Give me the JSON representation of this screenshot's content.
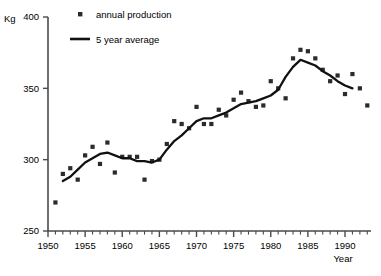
{
  "chart_data": {
    "type": "scatter",
    "title": "",
    "xlabel": "Year",
    "ylabel": "Kg",
    "xlim": [
      1950,
      1993.5
    ],
    "ylim": [
      250,
      400
    ],
    "yticks": [
      250,
      300,
      350,
      400
    ],
    "xticks": [
      1950,
      1955,
      1960,
      1965,
      1970,
      1975,
      1980,
      1985,
      1990
    ],
    "xminor_step": 1,
    "grid": false,
    "legend_position": "top-center",
    "legend": [
      {
        "name": "annual production",
        "marker": "square",
        "color": "#2b2b2b"
      },
      {
        "name": "5 year average",
        "marker": "line",
        "color": "#111111"
      }
    ],
    "series": [
      {
        "name": "annual production",
        "type": "scatter",
        "marker": "square",
        "color": "#2b2b2b",
        "x": [
          1951,
          1952,
          1953,
          1954,
          1955,
          1956,
          1957,
          1958,
          1959,
          1960,
          1961,
          1962,
          1963,
          1964,
          1965,
          1966,
          1967,
          1968,
          1969,
          1970,
          1971,
          1972,
          1973,
          1974,
          1975,
          1976,
          1977,
          1978,
          1979,
          1980,
          1981,
          1982,
          1983,
          1984,
          1985,
          1986,
          1987,
          1988,
          1989,
          1990,
          1991,
          1992,
          1993
        ],
        "y": [
          270,
          290,
          294,
          286,
          303,
          309,
          297,
          312,
          291,
          302,
          302,
          302,
          286,
          299,
          300,
          311,
          327,
          325,
          322,
          337,
          325,
          325,
          335,
          331,
          342,
          347,
          341,
          337,
          338,
          355,
          350,
          343,
          371,
          377,
          376,
          371,
          363,
          355,
          359,
          346,
          360,
          350,
          338
        ]
      },
      {
        "name": "5 year average",
        "type": "line",
        "color": "#111111",
        "x": [
          1952,
          1953,
          1954,
          1955,
          1956,
          1957,
          1958,
          1959,
          1960,
          1961,
          1962,
          1963,
          1964,
          1965,
          1966,
          1967,
          1968,
          1969,
          1970,
          1971,
          1972,
          1973,
          1974,
          1975,
          1976,
          1977,
          1978,
          1979,
          1980,
          1981,
          1982,
          1983,
          1984,
          1985,
          1986,
          1987,
          1988,
          1989,
          1990,
          1991
        ],
        "y": [
          285,
          288,
          293,
          298,
          301,
          304,
          305,
          303,
          301,
          301,
          299,
          299,
          298,
          300,
          307,
          313,
          317,
          322,
          327,
          329,
          329,
          331,
          333,
          336,
          339,
          340,
          341,
          343,
          345,
          349,
          358,
          365,
          370,
          368,
          366,
          362,
          359,
          355,
          352,
          350
        ]
      }
    ]
  }
}
